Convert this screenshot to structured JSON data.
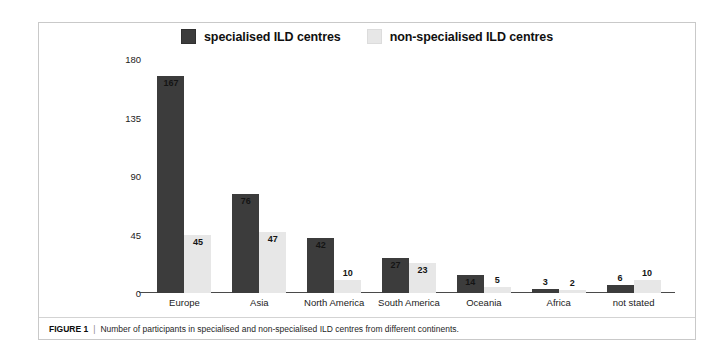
{
  "figure": {
    "caption_label": "FIGURE 1",
    "caption_separator": "|",
    "caption_text": "Number of participants in specialised and non-specialised ILD centres from different continents."
  },
  "colors": {
    "specialised": "#3c3c3c",
    "non_specialised": "#e7e7e7",
    "axis": "#4a4a4a",
    "frame": "#c9c9c9",
    "text": "#1a1a1a"
  },
  "chart_data": {
    "type": "bar",
    "title": "",
    "subtitle": "",
    "xlabel": "",
    "ylabel": "",
    "ylim": [
      0,
      180
    ],
    "yticks": [
      0,
      45,
      90,
      135,
      180
    ],
    "ytick_labels": [
      "0",
      "45",
      "90",
      "135",
      "180"
    ],
    "grid": false,
    "legend_position": "top-center",
    "grouping": "grouped",
    "categories": [
      "Europe",
      "Asia",
      "North America",
      "South America",
      "Oceania",
      "Africa",
      "not stated"
    ],
    "series": [
      {
        "name": "specialised ILD centres",
        "color": "#3c3c3c",
        "values": [
          167,
          76,
          42,
          27,
          14,
          3,
          6
        ]
      },
      {
        "name": "non-specialised ILD centres",
        "color": "#e7e7e7",
        "values": [
          45,
          47,
          10,
          23,
          5,
          2,
          10
        ]
      }
    ],
    "data_labels": {
      "specialised": [
        "167",
        "76",
        "42",
        "27",
        "14",
        "3",
        "6"
      ],
      "non_specialised": [
        "45",
        "47",
        "10",
        "23",
        "5",
        "2",
        "10"
      ]
    },
    "annotations": []
  }
}
